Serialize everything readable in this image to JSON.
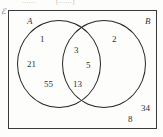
{
  "figure": {
    "kind": "venn-diagram",
    "universal_set_symbol": "ℰ",
    "top_cut_text": {
      "fragment_left": "......",
      "fragment_right": "[......]"
    },
    "sets": {
      "a_label": "A",
      "b_label": "B"
    },
    "regions": {
      "a_only": [
        "1",
        "21",
        "55"
      ],
      "intersection": [
        "3",
        "5",
        "13"
      ],
      "b_only": [
        "2",
        "34"
      ],
      "outside": [
        "8"
      ]
    },
    "colors": {
      "stroke": "#262626",
      "rect_stroke": "#3a3a3a",
      "text": "#2f2f2f",
      "background": "#fdfdfc"
    }
  },
  "chart_data": {
    "type": "table",
    "categories": [
      "A only",
      "A ∩ B",
      "B only",
      "Outside A ∪ B"
    ],
    "labels_in_region": [
      [
        "1",
        "21",
        "55"
      ],
      [
        "3",
        "5",
        "13"
      ],
      [
        "2",
        "34"
      ],
      [
        "8"
      ]
    ],
    "values": [
      77,
      21,
      36,
      8
    ],
    "legend": [
      "A",
      "B"
    ],
    "xlabel": "",
    "ylabel": ""
  }
}
